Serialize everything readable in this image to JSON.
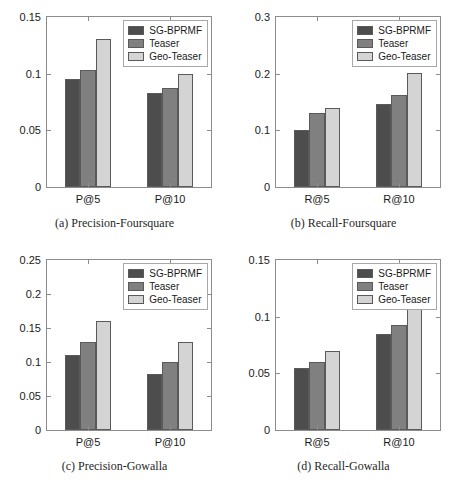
{
  "figure": {
    "top_clipped_text": "",
    "series_colors": {
      "SG-BPRMF": "#4d4d4d",
      "Teaser": "#808080",
      "Geo-Teaser": "#d4d4d4"
    },
    "axis_color": "#8c8c8c",
    "bar_edge_color": "#5a5a5a"
  },
  "legend": {
    "items": [
      {
        "label": "SG-BPRMF",
        "color": "#4d4d4d"
      },
      {
        "label": "Teaser",
        "color": "#808080"
      },
      {
        "label": "Geo-Teaser",
        "color": "#d4d4d4"
      }
    ]
  },
  "chart_data": [
    {
      "id": "a",
      "type": "bar",
      "title": "(a) Precision-Foursquare",
      "caption": "(a) Precision-Foursquare",
      "xlabel": "",
      "ylabel": "",
      "categories": [
        "P@5",
        "P@10"
      ],
      "series": [
        {
          "name": "SG-BPRMF",
          "values": [
            0.095,
            0.083
          ],
          "color": "#4d4d4d"
        },
        {
          "name": "Teaser",
          "values": [
            0.103,
            0.087
          ],
          "color": "#808080"
        },
        {
          "name": "Geo-Teaser",
          "values": [
            0.131,
            0.1
          ],
          "color": "#d4d4d4"
        }
      ],
      "ylim": [
        0,
        0.15
      ],
      "yticks": [
        0,
        0.05,
        0.1,
        0.15
      ],
      "yticklabels": [
        "0",
        "0.05",
        "0.1",
        "0.15"
      ],
      "grid": false,
      "legend_position": "top-right"
    },
    {
      "id": "b",
      "type": "bar",
      "title": "(b) Recall-Foursquare",
      "caption": "(b) Recall-Foursquare",
      "xlabel": "",
      "ylabel": "",
      "categories": [
        "R@5",
        "R@10"
      ],
      "series": [
        {
          "name": "SG-BPRMF",
          "values": [
            0.1,
            0.147
          ],
          "color": "#4d4d4d"
        },
        {
          "name": "Teaser",
          "values": [
            0.13,
            0.162
          ],
          "color": "#808080"
        },
        {
          "name": "Geo-Teaser",
          "values": [
            0.14,
            0.202
          ],
          "color": "#d4d4d4"
        }
      ],
      "ylim": [
        0,
        0.3
      ],
      "yticks": [
        0,
        0.1,
        0.2,
        0.3
      ],
      "yticklabels": [
        "0",
        "0.1",
        "0.2",
        "0.3"
      ],
      "grid": false,
      "legend_position": "top-right"
    },
    {
      "id": "c",
      "type": "bar",
      "title": "(c) Precision-Gowalla",
      "caption": "(c) Precision-Gowalla",
      "xlabel": "",
      "ylabel": "",
      "categories": [
        "P@5",
        "P@10"
      ],
      "series": [
        {
          "name": "SG-BPRMF",
          "values": [
            0.11,
            0.083
          ],
          "color": "#4d4d4d"
        },
        {
          "name": "Teaser",
          "values": [
            0.13,
            0.1
          ],
          "color": "#808080"
        },
        {
          "name": "Geo-Teaser",
          "values": [
            0.16,
            0.13
          ],
          "color": "#d4d4d4"
        }
      ],
      "ylim": [
        0,
        0.25
      ],
      "yticks": [
        0,
        0.05,
        0.1,
        0.15,
        0.2,
        0.25
      ],
      "yticklabels": [
        "0",
        "0.05",
        "0.1",
        "0.15",
        "0.2",
        "0.25"
      ],
      "grid": false,
      "legend_position": "top-right"
    },
    {
      "id": "d",
      "type": "bar",
      "title": "(d) Recall-Gowalla",
      "caption": "(d) Recall-Gowalla",
      "xlabel": "",
      "ylabel": "",
      "categories": [
        "R@5",
        "R@10"
      ],
      "series": [
        {
          "name": "SG-BPRMF",
          "values": [
            0.055,
            0.085
          ],
          "color": "#4d4d4d"
        },
        {
          "name": "Teaser",
          "values": [
            0.06,
            0.093
          ],
          "color": "#808080"
        },
        {
          "name": "Geo-Teaser",
          "values": [
            0.07,
            0.108
          ],
          "color": "#d4d4d4"
        }
      ],
      "ylim": [
        0,
        0.15
      ],
      "yticks": [
        0,
        0.05,
        0.1,
        0.15
      ],
      "yticklabels": [
        "0",
        "0.05",
        "0.1",
        "0.15"
      ],
      "grid": false,
      "legend_position": "top-right"
    }
  ]
}
